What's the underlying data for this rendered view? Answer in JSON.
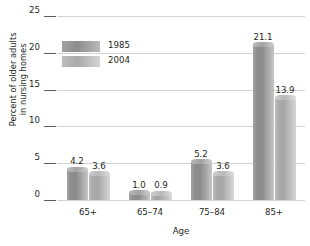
{
  "chart_data": {
    "type": "bar",
    "title": "",
    "xlabel": "Age",
    "ylabel_line1": "Percent of older adults",
    "ylabel_line2": "in nursing homes",
    "categories": [
      "65+",
      "65–74",
      "75–84",
      "85+"
    ],
    "series": [
      {
        "name": "1985",
        "color": "#8e8e8e",
        "values": [
          4.2,
          1.0,
          5.2,
          21.1
        ],
        "value_labels": [
          "4.2",
          "1.0",
          "5.2",
          "21.1"
        ]
      },
      {
        "name": "2004",
        "color": "#bdbdbd",
        "values": [
          3.6,
          0.9,
          3.6,
          13.9
        ],
        "value_labels": [
          "3.6",
          "0.9",
          "3.6",
          "13.9"
        ]
      }
    ],
    "ylim": [
      0,
      25
    ],
    "yticks": [
      0,
      5,
      10,
      15,
      20,
      25
    ],
    "ytick_labels": [
      "0",
      "5",
      "10",
      "15",
      "20",
      "25"
    ],
    "grid": true,
    "legend_position": "upper-left-inside"
  }
}
